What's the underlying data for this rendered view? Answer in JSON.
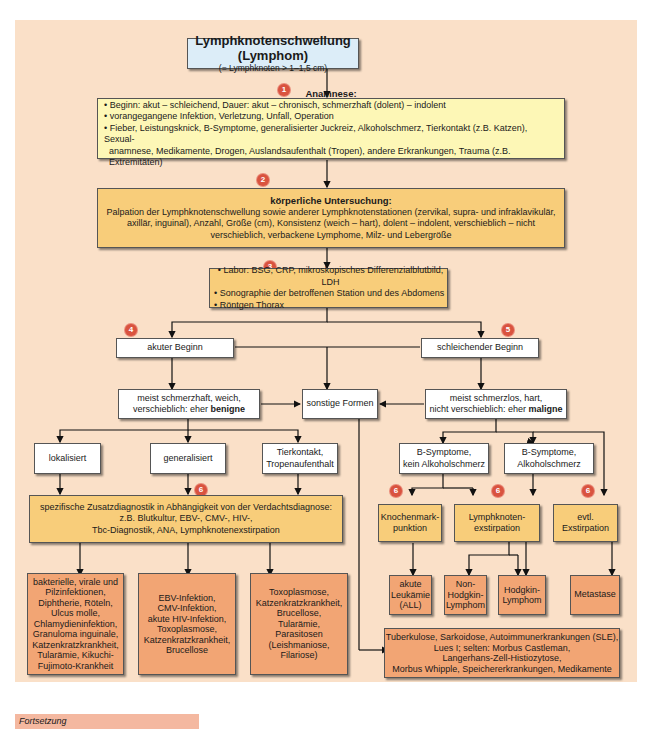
{
  "title": {
    "main": "Lymphknotenschwellung (Lymphom)",
    "sub": "(= Lymphknoten > 1–1,5 cm)"
  },
  "steps": {
    "anamnese": {
      "badge": "1",
      "heading": "Anamnese:",
      "items": [
        "• Beginn: akut – schleichend, Dauer: akut – chronisch, schmerzhaft (dolent) – indolent",
        "• vorangegangene Infektion, Verletzung, Unfall, Operation",
        "• Fieber, Leistungsknick, B-Symptome, generalisierter Juckreiz, Alkoholschmerz, Tierkontakt (z.B. Katzen), Sexual-",
        "  anamnese, Medikamente, Drogen, Auslandsaufenthalt (Tropen), andere Erkrankungen, Trauma (z.B. Extremitäten)"
      ]
    },
    "untersuchung": {
      "badge": "2",
      "heading": "körperliche Untersuchung:",
      "text": "Palpation der Lymphknotenschwellung sowie anderer Lymphknotenstationen (zervikal, supra- und infraklavikulär, axillär, inguinal), Anzahl, Größe (cm), Konsistenz (weich – hart), dolent – indolent, verschieblich – nicht verschieblich, verbackene Lymphome, Milz- und Lebergröße"
    },
    "labor": {
      "badge": "3",
      "items": [
        "• Labor: BSG, CRP, mikroskopisches Differenzialblutbild, LDH",
        "• Sonographie der betroffenen Station und des Abdomens",
        "• Röntgen Thorax"
      ]
    }
  },
  "branches": {
    "akut": {
      "badge": "4",
      "label": "akuter Beginn"
    },
    "schleichend": {
      "badge": "5",
      "label": "schleichender Beginn"
    },
    "benigne": {
      "line1": "meist schmerzhaft, weich,",
      "line2": "verschieblich: eher ",
      "bold": "benigne"
    },
    "sonstige": {
      "label": "sonstige Formen"
    },
    "maligne": {
      "line1": "meist schmerzlos, hart,",
      "line2": "nicht verschieblich: eher ",
      "bold": "maligne"
    },
    "lokalisiert": {
      "label": "lokalisiert"
    },
    "generalisiert": {
      "label": "generalisiert"
    },
    "tierkontakt": {
      "line1": "Tierkontakt,",
      "line2": "Tropenaufenthalt"
    },
    "b_kein": {
      "line1": "B-Symptome,",
      "line2": "kein Alkoholschmerz"
    },
    "b_alkohol": {
      "line1": "B-Symptome,",
      "line2": "Alkoholschmerz"
    }
  },
  "diagnostics": {
    "zusatz": {
      "badge": "6",
      "lines": [
        "spezifische Zusatzdiagnostik in Abhängigkeit von der Verdachtsdiagnose:",
        "z.B. Blutkultur, EBV-, CMV-, HIV-,",
        "Tbc-Diagnostik, ANA, Lymphknotenexstirpation"
      ]
    },
    "knochenmark": {
      "badge": "6",
      "line1": "Knochenmark-",
      "line2": "punktion"
    },
    "lk_exstirpation": {
      "badge": "6",
      "line1": "Lymphknoten-",
      "line2": "exstirpation"
    },
    "evtl": {
      "badge": "6",
      "line1": "evtl.",
      "line2": "Exstirpation"
    }
  },
  "results": {
    "lokal": [
      "bakterielle, virale und",
      "Pilzinfektionen,",
      "Diphtherie, Röteln,",
      "Ulcus molle,",
      "Chlamydieninfektion,",
      "Granuloma inguinale,",
      "Katzenkratzkrankheit,",
      "Tularämie, Kikuchi-",
      "Fujimoto-Krankheit"
    ],
    "general": [
      "EBV-Infektion,",
      "CMV-Infektion,",
      "akute HIV-Infektion,",
      "Toxoplasmose,",
      "Katzenkratzkrankheit,",
      "Brucellose"
    ],
    "tier": [
      "Toxoplasmose,",
      "Katzenkratzkrankheit,",
      "Brucellose,",
      "Tularämie,",
      "Parasitosen",
      "(Leishmaniose,",
      "Filariose)"
    ],
    "all": [
      "akute",
      "Leukämie",
      "(ALL)"
    ],
    "nhl": [
      "Non-",
      "Hodgkin-",
      "Lymphom"
    ],
    "hodgkin": [
      "Hodgkin-",
      "Lymphom"
    ],
    "metastase": [
      "Metastase"
    ],
    "sonstige": [
      "Tuberkulose, Sarkoidose, Autoimmunerkrankungen (SLE),",
      "Lues I; selten: Morbus Castleman,",
      "Langerhans-Zell-Histiozytose,",
      "Morbus Whipple, Speichererkrankungen, Medikamente"
    ]
  },
  "footer": {
    "label": "Fortsetzung"
  },
  "colors": {
    "panel_bg": "#fae0c8",
    "title_box": "#dcedf8",
    "anamnese_box": "#fdf7b6",
    "step_box": "#f8cd7a",
    "result_box": "#f2a574",
    "badge": "#d9533f",
    "footer_bar": "#f4b8a0"
  }
}
